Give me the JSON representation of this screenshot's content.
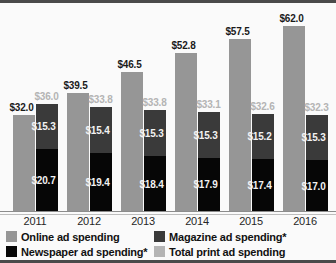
{
  "chart_data": {
    "type": "bar",
    "title": "",
    "subtitle": "",
    "xlabel": "",
    "ylabel": "",
    "ylim": [
      0,
      68
    ],
    "grid": false,
    "legend_position": "bottom-left",
    "categories": [
      "2011",
      "2012",
      "2013",
      "2014",
      "2015",
      "2016"
    ],
    "series": [
      {
        "name": "Online ad spending",
        "color": "#969696",
        "values": [
          32.0,
          39.5,
          46.5,
          52.8,
          57.5,
          62.0
        ],
        "labels": [
          "$32.0",
          "$39.5",
          "$46.5",
          "$52.8",
          "$57.5",
          "$62.0"
        ]
      },
      {
        "name": "Magazine ad spending*",
        "color": "#3a3a3a",
        "values": [
          15.3,
          15.4,
          15.3,
          15.3,
          15.2,
          15.3
        ],
        "labels": [
          "$15.3",
          "$15.4",
          "$15.3",
          "$15.3",
          "$15.2",
          "$15.3"
        ]
      },
      {
        "name": "Newspaper ad spending*",
        "color": "#060606",
        "values": [
          20.7,
          19.4,
          18.4,
          17.9,
          17.4,
          17.0
        ],
        "labels": [
          "$20.7",
          "$19.4",
          "$18.4",
          "$17.9",
          "$17.4",
          "$17.0"
        ]
      },
      {
        "name": "Total print ad spending",
        "color": "#b4b4b4",
        "values": [
          36.0,
          33.8,
          33.8,
          33.1,
          32.6,
          32.3
        ],
        "labels": [
          "$36.0",
          "$33.8",
          "$33.8",
          "$33.1",
          "$32.6",
          "$32.3"
        ]
      }
    ]
  },
  "axis": {
    "ticks": [
      "2011",
      "2012",
      "2013",
      "2014",
      "2015",
      "2016"
    ]
  },
  "legend": {
    "items": [
      {
        "label": "Online ad spending",
        "color": "#969696"
      },
      {
        "label": "Magazine ad spending*",
        "color": "#3a3a3a"
      },
      {
        "label": "Newspaper ad spending*",
        "color": "#060606"
      },
      {
        "label": "Total print ad spending",
        "color": "#b4b4b4"
      }
    ]
  }
}
